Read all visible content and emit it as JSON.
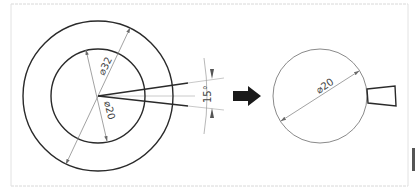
{
  "diagram": {
    "title": "",
    "left_figure": {
      "outer_circle_label": "⌀32",
      "inner_circle_label": "⌀20",
      "angle_label": "15°"
    },
    "transition": {
      "arrow": "right-arrow-icon"
    },
    "right_figure": {
      "circle_label": "⌀20",
      "tool_shape": "trapezoid"
    }
  },
  "colors": {
    "stroke_dark": "#2a2a2a",
    "stroke_light": "#9a9a9a",
    "frame": "#d8d8d8",
    "arrow_fill": "#1a1a1a"
  }
}
